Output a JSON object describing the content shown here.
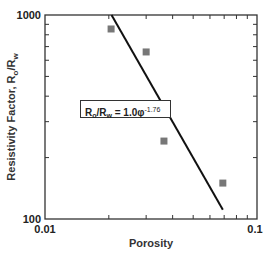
{
  "chart_data": {
    "type": "scatter",
    "title": "",
    "xlabel": "Porosity",
    "ylabel": "Resistivity Factor, Ro/Rw",
    "xscale": "log",
    "yscale": "log",
    "xlim": [
      0.01,
      0.1
    ],
    "ylim": [
      100,
      1000
    ],
    "x_tick_labels": [
      "0.01",
      "0.1"
    ],
    "y_tick_labels": [
      "100",
      "1000"
    ],
    "grid": false,
    "series": [
      {
        "name": "Measured",
        "marker": "square",
        "color": "#777777",
        "x": [
          0.0205,
          0.03,
          0.0364,
          0.069
        ],
        "y": [
          854,
          659,
          241,
          150
        ]
      },
      {
        "name": "Fit",
        "type": "line",
        "color": "#111111",
        "equation": "Ro/Rw = 1.0φ^-1.76",
        "x": [
          0.0206,
          0.069
        ],
        "y": [
          1000,
          111
        ]
      }
    ],
    "annotations": [
      {
        "text": "Ro/Rw = 1.0φ-1.76",
        "boxed": true
      }
    ]
  },
  "labels": {
    "y_top": "1000",
    "y_bottom": "100",
    "x_left": "0.01",
    "x_right": "0.1",
    "xlabel": "Porosity",
    "ylabel_main": "Resistivity Factor, R",
    "ylabel_sub1": "o",
    "ylabel_mid": "/R",
    "ylabel_sub2": "w",
    "eq_r1": "R",
    "eq_s1": "o",
    "eq_r2": "/R",
    "eq_s2": "w",
    "eq_rest": " = 1.0φ",
    "eq_exp": "-1.76"
  }
}
